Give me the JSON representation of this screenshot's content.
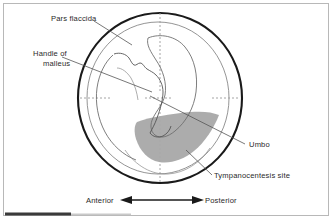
{
  "figure": {
    "background_color": "#ffffff",
    "frame_color": "#b4b4b4",
    "shade_color": "#a8a8a8",
    "outline_color": "#1a1a1a",
    "inner_line_color": "#6f6f6f",
    "dotted_color": "#9a9a9a",
    "leader_color": "#555555",
    "text_color": "#2a2a2a"
  },
  "labels": {
    "pars_flaccida": "Pars flaccida",
    "handle_of_malleus_line1": "Handle of",
    "handle_of_malleus_line2": "malleus",
    "umbo": "Umbo",
    "tympanocentesis_site": "Tympanocentesis site"
  },
  "orientation_axis": {
    "left_label": "Anterior",
    "right_label": "Posterior",
    "arrow": "double-headed-horizontal-arrow"
  },
  "icons": {
    "eardrum_outline": "circle-outline-icon",
    "malleus_handle": "malleus-handle-icon",
    "umbo_marker": "umbo-point-icon",
    "shaded_region": "crescent-shade-icon",
    "quadrant_crosshair": "dotted-crosshair-icon",
    "anterior_arrow": "arrow-left-icon",
    "posterior_arrow": "arrow-right-icon",
    "scan_artifact": "dark-bar-artifact-icon"
  }
}
